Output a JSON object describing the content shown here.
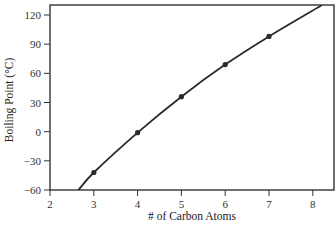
{
  "chart_data": {
    "type": "line",
    "title": "",
    "xlabel": "# of Carbon Atoms",
    "ylabel": "Boiling Point (°C)",
    "xlim": [
      2,
      8.5
    ],
    "ylim": [
      -60,
      130
    ],
    "x_ticks": [
      2,
      3,
      4,
      5,
      6,
      7,
      8
    ],
    "y_ticks": [
      -60,
      -30,
      0,
      30,
      60,
      90,
      120
    ],
    "grid": false,
    "legend": null,
    "series": [
      {
        "name": "Boiling Point",
        "x": [
          3,
          4,
          5,
          6,
          7
        ],
        "values": [
          -42,
          -1,
          36,
          69,
          98
        ],
        "markers": true,
        "trend_curve": {
          "x_start": 2.65,
          "y_start": -60,
          "x_end": 8.2,
          "y_end": 130
        }
      }
    ]
  },
  "colors": {
    "line": "#2a2a2a",
    "axis": "#333333",
    "marker": "#2a2a2a"
  }
}
